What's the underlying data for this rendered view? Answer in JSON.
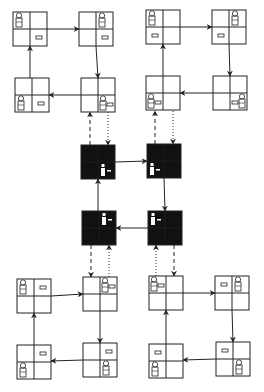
{
  "diagram": {
    "colors": {
      "line": "#222222",
      "box_fill": "#ffffff",
      "abstract_fill": "#111111",
      "abstract_glyph": "#ffffff"
    },
    "box_size": 34,
    "groups": [
      {
        "name": "top-left-cycle",
        "boxes": [
          {
            "id": "tl-a",
            "x": 13,
            "y": 12,
            "agent": "tl",
            "key": "br"
          },
          {
            "id": "tl-b",
            "x": 79,
            "y": 12,
            "agent": "tr",
            "key": "br"
          },
          {
            "id": "tl-d",
            "x": 81,
            "y": 78,
            "agent": "br",
            "key": "br-right"
          },
          {
            "id": "tl-c",
            "x": 15,
            "y": 78,
            "agent": "bl",
            "key": "br"
          }
        ]
      },
      {
        "name": "top-right-cycle",
        "boxes": [
          {
            "id": "tr-a",
            "x": 146,
            "y": 10,
            "agent": "tl",
            "key": "bl"
          },
          {
            "id": "tr-b",
            "x": 212,
            "y": 10,
            "agent": "tr",
            "key": "bl"
          },
          {
            "id": "tr-d",
            "x": 213,
            "y": 76,
            "agent": "br",
            "key": "br-left"
          },
          {
            "id": "tr-c",
            "x": 146,
            "y": 76,
            "agent": "bl",
            "key": "bl-right"
          }
        ]
      },
      {
        "name": "center-abstract-cycle",
        "boxes": [
          {
            "id": "abs-1",
            "x": 81,
            "y": 145,
            "agent": "br",
            "key": "br-right"
          },
          {
            "id": "abs-2",
            "x": 147,
            "y": 144,
            "agent": "bl",
            "key": "bl-right"
          },
          {
            "id": "abs-4",
            "x": 148,
            "y": 211,
            "agent": "tl",
            "key": "tl-right"
          },
          {
            "id": "abs-3",
            "x": 82,
            "y": 211,
            "agent": "tr",
            "key": "tr-right"
          }
        ]
      },
      {
        "name": "bottom-left-cycle",
        "boxes": [
          {
            "id": "bl-a",
            "x": 17,
            "y": 279,
            "agent": "tl",
            "key": "tr"
          },
          {
            "id": "bl-b",
            "x": 83,
            "y": 277,
            "agent": "tr",
            "key": "tr-right"
          },
          {
            "id": "bl-d",
            "x": 83,
            "y": 343,
            "agent": "br",
            "key": "tr"
          },
          {
            "id": "bl-c",
            "x": 17,
            "y": 345,
            "agent": "bl",
            "key": "tr"
          }
        ]
      },
      {
        "name": "bottom-right-cycle",
        "boxes": [
          {
            "id": "br-a",
            "x": 149,
            "y": 276,
            "agent": "tl",
            "key": "tl-right"
          },
          {
            "id": "br-b",
            "x": 215,
            "y": 276,
            "agent": "tr",
            "key": "tl"
          },
          {
            "id": "br-d",
            "x": 216,
            "y": 342,
            "agent": "br",
            "key": "tl"
          },
          {
            "id": "br-c",
            "x": 149,
            "y": 344,
            "agent": "bl",
            "key": "tl"
          }
        ]
      }
    ],
    "arrows": [
      {
        "from": [
          46,
          29
        ],
        "to": [
          79,
          29
        ],
        "style": "solid"
      },
      {
        "from": [
          96,
          46
        ],
        "to": [
          98,
          78
        ],
        "style": "solid"
      },
      {
        "from": [
          81,
          95
        ],
        "to": [
          49,
          95
        ],
        "style": "solid"
      },
      {
        "from": [
          30,
          78
        ],
        "to": [
          30,
          46
        ],
        "style": "solid"
      },
      {
        "from": [
          180,
          27
        ],
        "to": [
          212,
          27
        ],
        "style": "solid"
      },
      {
        "from": [
          229,
          44
        ],
        "to": [
          230,
          76
        ],
        "style": "solid"
      },
      {
        "from": [
          213,
          93
        ],
        "to": [
          180,
          93
        ],
        "style": "solid"
      },
      {
        "from": [
          163,
          76
        ],
        "to": [
          163,
          44
        ],
        "style": "solid"
      },
      {
        "from": [
          115,
          162
        ],
        "to": [
          147,
          161
        ],
        "style": "solid"
      },
      {
        "from": [
          164,
          178
        ],
        "to": [
          165,
          211
        ],
        "style": "solid"
      },
      {
        "from": [
          148,
          228
        ],
        "to": [
          116,
          228
        ],
        "style": "solid"
      },
      {
        "from": [
          98,
          211
        ],
        "to": [
          98,
          179
        ],
        "style": "solid"
      },
      {
        "from": [
          51,
          296
        ],
        "to": [
          83,
          294
        ],
        "style": "solid"
      },
      {
        "from": [
          100,
          311
        ],
        "to": [
          100,
          343
        ],
        "style": "solid"
      },
      {
        "from": [
          83,
          360
        ],
        "to": [
          51,
          361
        ],
        "style": "solid"
      },
      {
        "from": [
          34,
          345
        ],
        "to": [
          34,
          313
        ],
        "style": "solid"
      },
      {
        "from": [
          183,
          293
        ],
        "to": [
          215,
          293
        ],
        "style": "solid"
      },
      {
        "from": [
          232,
          310
        ],
        "to": [
          233,
          342
        ],
        "style": "solid"
      },
      {
        "from": [
          216,
          359
        ],
        "to": [
          183,
          360
        ],
        "style": "solid"
      },
      {
        "from": [
          166,
          344
        ],
        "to": [
          166,
          310
        ],
        "style": "solid"
      },
      {
        "from": [
          90,
          145
        ],
        "to": [
          90,
          112
        ],
        "style": "dashed"
      },
      {
        "from": [
          108,
          112
        ],
        "to": [
          108,
          145
        ],
        "style": "dotted"
      },
      {
        "from": [
          155,
          144
        ],
        "to": [
          155,
          111
        ],
        "style": "dashed"
      },
      {
        "from": [
          173,
          111
        ],
        "to": [
          173,
          144
        ],
        "style": "dotted"
      },
      {
        "from": [
          91,
          245
        ],
        "to": [
          91,
          277
        ],
        "style": "dashed"
      },
      {
        "from": [
          109,
          277
        ],
        "to": [
          109,
          245
        ],
        "style": "dotted"
      },
      {
        "from": [
          174,
          245
        ],
        "to": [
          174,
          276
        ],
        "style": "dashed"
      },
      {
        "from": [
          156,
          276
        ],
        "to": [
          156,
          245
        ],
        "style": "dotted"
      }
    ]
  }
}
